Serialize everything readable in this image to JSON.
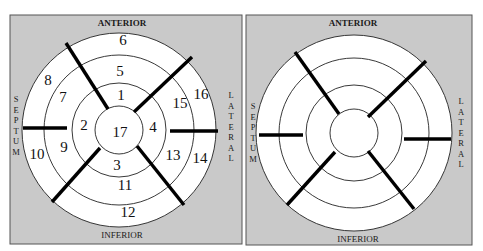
{
  "colors": {
    "panel_background": "#c9c9c9",
    "ring_fill": "#ffffff",
    "ring_stroke": "#222222",
    "spoke": "#000000",
    "text": "#111111"
  },
  "panels": [
    {
      "id": "left",
      "rect": {
        "x": 10,
        "y": 15,
        "w": 232,
        "h": 229
      },
      "center": {
        "x": 119,
        "y": 130
      },
      "radii": [
        97,
        75,
        47,
        24
      ],
      "labels": {
        "top": "ANTERIOR",
        "bottom": "INFERIOR",
        "left": "SEPTUM",
        "right": "LATERAL"
      },
      "label_positions": {
        "top": {
          "x": 122,
          "y": 26
        },
        "bottom": {
          "x": 122,
          "y": 238
        },
        "left": {
          "x": 16,
          "y": 102
        },
        "right": {
          "x": 231,
          "y": 98
        }
      },
      "spokes": [
        {
          "x1": 66,
          "y1": 43,
          "x2": 108,
          "y2": 109
        },
        {
          "x1": 192,
          "y1": 57,
          "x2": 134,
          "y2": 112
        },
        {
          "x1": 23,
          "y1": 128,
          "x2": 67,
          "y2": 128
        },
        {
          "x1": 170,
          "y1": 131,
          "x2": 218,
          "y2": 131
        },
        {
          "x1": 52,
          "y1": 202,
          "x2": 100,
          "y2": 148
        },
        {
          "x1": 184,
          "y1": 205,
          "x2": 137,
          "y2": 146
        }
      ],
      "segments": [
        {
          "number": "1",
          "x": 121,
          "y": 95
        },
        {
          "number": "2",
          "x": 84,
          "y": 125
        },
        {
          "number": "3",
          "x": 117,
          "y": 165
        },
        {
          "number": "4",
          "x": 153,
          "y": 127
        },
        {
          "number": "5",
          "x": 120,
          "y": 71
        },
        {
          "number": "6",
          "x": 123,
          "y": 40
        },
        {
          "number": "7",
          "x": 63,
          "y": 97
        },
        {
          "number": "8",
          "x": 48,
          "y": 80
        },
        {
          "number": "9",
          "x": 64,
          "y": 147
        },
        {
          "number": "10",
          "x": 37,
          "y": 154
        },
        {
          "number": "11",
          "x": 125,
          "y": 185
        },
        {
          "number": "12",
          "x": 128,
          "y": 212
        },
        {
          "number": "13",
          "x": 173,
          "y": 155
        },
        {
          "number": "14",
          "x": 200,
          "y": 158
        },
        {
          "number": "15",
          "x": 180,
          "y": 103
        },
        {
          "number": "16",
          "x": 201,
          "y": 94
        },
        {
          "number": "17",
          "x": 120,
          "y": 132
        }
      ]
    },
    {
      "id": "right",
      "rect": {
        "x": 246,
        "y": 15,
        "w": 226,
        "h": 230
      },
      "center": {
        "x": 354,
        "y": 133
      },
      "radii": [
        98,
        75,
        48,
        24
      ],
      "labels": {
        "top": "ANTERIOR",
        "bottom": "INFERIOR",
        "left": "SEPTUM",
        "right": "LATERAL"
      },
      "label_positions": {
        "top": {
          "x": 353,
          "y": 26
        },
        "bottom": {
          "x": 358,
          "y": 242
        },
        "left": {
          "x": 253,
          "y": 109
        },
        "right": {
          "x": 461,
          "y": 104
        }
      },
      "spokes": [
        {
          "x1": 295,
          "y1": 52,
          "x2": 339,
          "y2": 114
        },
        {
          "x1": 426,
          "y1": 61,
          "x2": 368,
          "y2": 117
        },
        {
          "x1": 259,
          "y1": 135,
          "x2": 303,
          "y2": 135
        },
        {
          "x1": 404,
          "y1": 139,
          "x2": 451,
          "y2": 139
        },
        {
          "x1": 287,
          "y1": 205,
          "x2": 335,
          "y2": 152
        },
        {
          "x1": 414,
          "y1": 209,
          "x2": 368,
          "y2": 151
        }
      ],
      "segments": []
    }
  ]
}
